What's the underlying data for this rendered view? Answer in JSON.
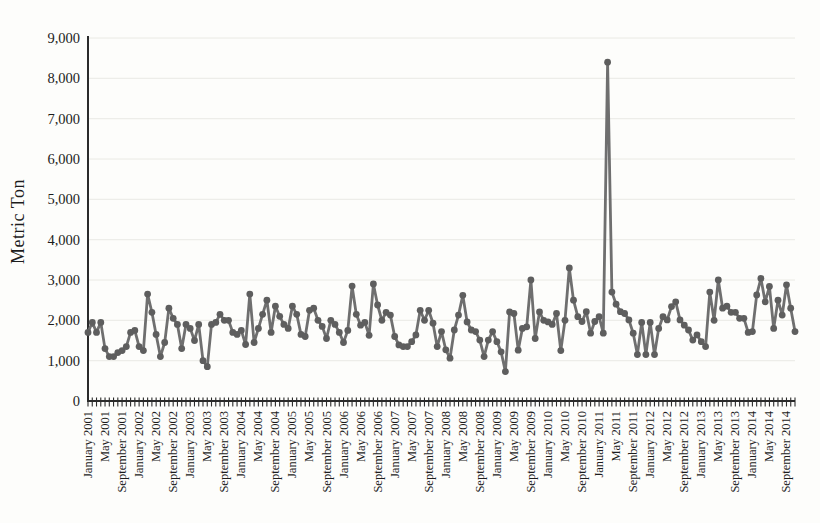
{
  "chart_data": {
    "type": "line",
    "title": "",
    "ylabel": "Metric Ton",
    "xlabel": "",
    "ylim": [
      0,
      9000
    ],
    "ytick_step": 1000,
    "ytick_labels": [
      "0",
      "1,000",
      "2,000",
      "3,000",
      "4,000",
      "5,000",
      "6,000",
      "7,000",
      "8,000",
      "9,000"
    ],
    "x_interval": "monthly",
    "x_start": "January 2001",
    "x_end": "November 2014",
    "x_tick_label_every_months": 4,
    "x_tick_labels": [
      "January 2001",
      "May 2001",
      "September 2001",
      "January 2002",
      "May 2002",
      "September 2002",
      "January 2003",
      "May 2003",
      "September 2003",
      "January 2004",
      "May 2004",
      "September 2004",
      "January 2005",
      "May 2005",
      "September 2005",
      "January 2006",
      "May 2006",
      "September 2006",
      "January 2007",
      "May 2007",
      "September 2007",
      "January 2008",
      "May 2008",
      "September 2008",
      "January 2009",
      "May 2009",
      "September 2009",
      "January 2010",
      "May 2010",
      "September 2010",
      "January 2011",
      "May 2011",
      "September 2011",
      "January 2012",
      "May 2012",
      "September 2012",
      "January 2013",
      "May 2013",
      "September 2013",
      "January 2014",
      "May 2014",
      "September 2014"
    ],
    "series": [
      {
        "name": "Metric Ton",
        "values": [
          1700,
          1950,
          1700,
          1950,
          1300,
          1100,
          1100,
          1200,
          1250,
          1350,
          1700,
          1750,
          1350,
          1250,
          2650,
          2200,
          1650,
          1100,
          1450,
          2300,
          2050,
          1900,
          1300,
          1900,
          1800,
          1500,
          1900,
          1000,
          850,
          1900,
          1950,
          2150,
          2000,
          2000,
          1700,
          1650,
          1750,
          1400,
          2650,
          1450,
          1800,
          2150,
          2500,
          1700,
          2350,
          2100,
          1900,
          1800,
          2350,
          2150,
          1650,
          1600,
          2250,
          2300,
          2000,
          1850,
          1550,
          2000,
          1900,
          1700,
          1450,
          1750,
          2850,
          2150,
          1880,
          1950,
          1630,
          2900,
          2380,
          2000,
          2200,
          2130,
          1600,
          1390,
          1350,
          1350,
          1470,
          1640,
          2250,
          2000,
          2250,
          1930,
          1350,
          1720,
          1270,
          1060,
          1760,
          2130,
          2620,
          1960,
          1760,
          1720,
          1510,
          1100,
          1510,
          1720,
          1470,
          1220,
          730,
          2210,
          2170,
          1260,
          1800,
          1840,
          3000,
          1550,
          2210,
          2000,
          1960,
          1900,
          2170,
          1250,
          2000,
          3300,
          2500,
          2090,
          1970,
          2215,
          1680,
          1970,
          2090,
          1680,
          8400,
          2700,
          2400,
          2215,
          2170,
          2010,
          1680,
          1150,
          1950,
          1150,
          1950,
          1150,
          1800,
          2090,
          2010,
          2340,
          2460,
          2010,
          1880,
          1760,
          1510,
          1640,
          1470,
          1350,
          2700,
          2000,
          3000,
          2300,
          2350,
          2200,
          2200,
          2050,
          2050,
          1700,
          1720,
          2630,
          3040,
          2460,
          2840,
          1800,
          2500,
          2130,
          2880,
          2300,
          1720
        ]
      }
    ],
    "legend": "none",
    "grid": "horizontal-faint",
    "line_color": "#6f6f6f",
    "marker_color": "#5e5e5e",
    "axis_color": "#2b2b2b",
    "grid_color": "#e6e6e0",
    "text_color": "#1c1c1c",
    "background": "#fdfdfb"
  }
}
